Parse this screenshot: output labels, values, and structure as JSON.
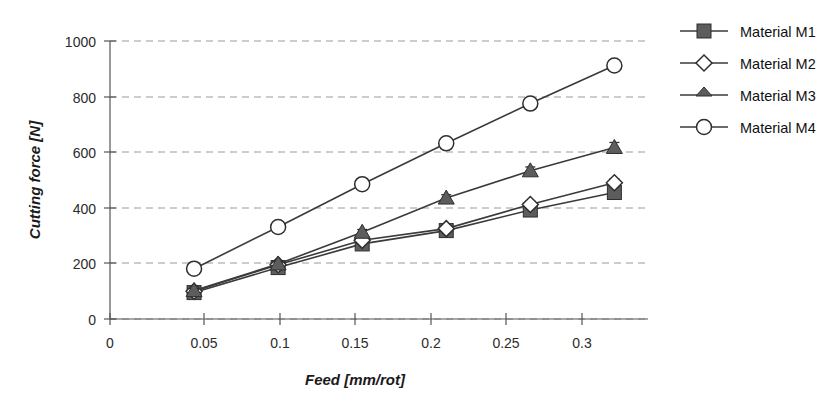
{
  "chart_data": {
    "type": "line",
    "title": "",
    "subtitle": "",
    "xlabel": "Feed [mm/rot]",
    "ylabel": "Cutting force [N]",
    "x": [
      0.05,
      0.1,
      0.15,
      0.2,
      0.25,
      0.3
    ],
    "xlim": [
      0,
      0.32
    ],
    "ylim": [
      0,
      1000
    ],
    "xticks": [
      0,
      0.05,
      0.1,
      0.15,
      0.2,
      0.25,
      0.3
    ],
    "xtick_labels": [
      "0",
      "0.05",
      "0.1",
      "0.15",
      "0.2",
      "0.25",
      "0.3"
    ],
    "yticks": [
      0,
      200,
      400,
      600,
      800,
      1000
    ],
    "ytick_labels": [
      "0",
      "200",
      "400",
      "600",
      "800",
      "1000"
    ],
    "grid": "horizontal-dashed",
    "legend_position": "right",
    "series": [
      {
        "name": "Material M1",
        "marker": "filled-square",
        "values": [
          95,
          185,
          270,
          318,
          392,
          455
        ],
        "errors": [
          8,
          8,
          10,
          10,
          12,
          12
        ]
      },
      {
        "name": "Material M2",
        "marker": "open-diamond",
        "values": [
          100,
          195,
          283,
          325,
          412,
          490
        ],
        "errors": [
          8,
          8,
          10,
          10,
          12,
          14
        ]
      },
      {
        "name": "Material M3",
        "marker": "filled-triangle",
        "values": [
          102,
          198,
          312,
          435,
          533,
          617
        ],
        "errors": [
          8,
          8,
          10,
          12,
          14,
          18
        ]
      },
      {
        "name": "Material M4",
        "marker": "open-circle",
        "values": [
          181,
          331,
          485,
          632,
          775,
          912
        ],
        "errors": [
          8,
          8,
          10,
          12,
          16,
          18
        ]
      }
    ]
  },
  "legend": {
    "items": [
      {
        "label": "Material M1",
        "marker": "filled-square"
      },
      {
        "label": "Material M2",
        "marker": "open-diamond"
      },
      {
        "label": "Material M3",
        "marker": "filled-triangle"
      },
      {
        "label": "Material M4",
        "marker": "open-circle"
      }
    ]
  },
  "colors": {
    "background": "#ffffff",
    "line": "#3a3a3a",
    "marker_fill": "#5d5d5d",
    "marker_stroke": "#2e2e2e",
    "grid": "#9a9a9a",
    "axis": "#555555",
    "text": "#1a1a1a"
  }
}
